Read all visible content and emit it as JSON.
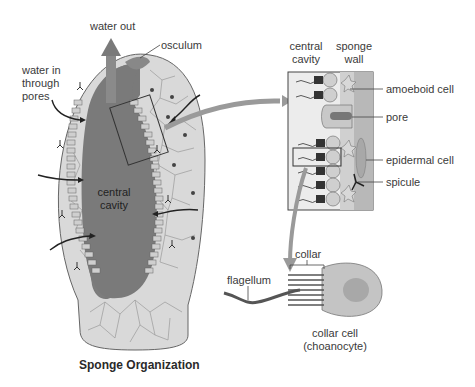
{
  "title": "Sponge Organization",
  "sponge": {
    "labels": {
      "water_out": "water out",
      "osculum": "osculum",
      "water_in_line1": "water in",
      "water_in_line2": "through",
      "water_in_line3": "pores",
      "central_cavity_line1": "central",
      "central_cavity_line2": "cavity"
    }
  },
  "inset": {
    "headers": {
      "central_cavity_line1": "central",
      "central_cavity_line2": "cavity",
      "sponge_wall_line1": "sponge",
      "sponge_wall_line2": "wall"
    },
    "labels": {
      "amoeboid_cell": "amoeboid cell",
      "pore": "pore",
      "epidermal_cell": "epidermal cell",
      "spicule": "spicule"
    }
  },
  "collar_cell": {
    "labels": {
      "collar": "collar",
      "flagellum": "flagellum",
      "name_line1": "collar cell",
      "name_line2": "(choanocyte)"
    }
  },
  "colors": {
    "body": "#d6d6d6",
    "cavity": "#7a7a7a",
    "arrow": "#8a8a8a",
    "outline": "#555555"
  }
}
